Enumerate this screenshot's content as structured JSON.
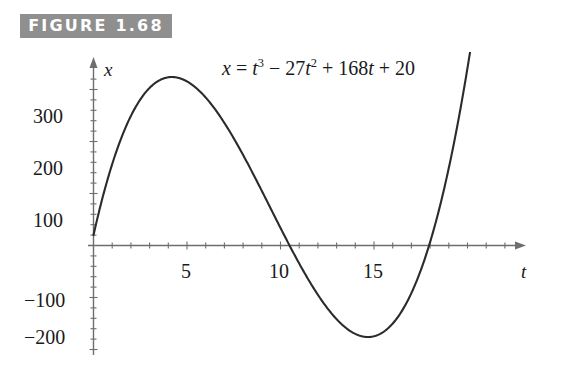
{
  "figure": {
    "label": "FIGURE 1.68",
    "banner_color": "#8f8f8f",
    "banner_text_color": "#ffffff",
    "background_color": "#ffffff",
    "curve_color": "#2b2b2b",
    "axis_color": "#6e6e6e"
  },
  "equation": {
    "lhs": "x",
    "equals": "=",
    "term1_base": "t",
    "term1_exp": "3",
    "op1": "−",
    "term2_coeff": "27",
    "term2_base": "t",
    "term2_exp": "2",
    "op2": "+",
    "term3": "168",
    "term3_base": "t",
    "op3": "+",
    "term4": "20",
    "plain": "x = t^3 - 27t^2 + 168t + 20"
  },
  "axes": {
    "x_axis_name": "t",
    "y_axis_name": "x",
    "x_ticks": [
      "5",
      "10",
      "15"
    ],
    "y_ticks": [
      "300",
      "200",
      "100",
      "−100",
      "−200"
    ]
  },
  "chart_data": {
    "type": "line",
    "title": "FIGURE 1.68",
    "annotation": "x = t³ − 27t² + 168t + 20",
    "xlabel": "t",
    "ylabel": "x",
    "xlim": [
      0,
      21.5
    ],
    "ylim": [
      -250,
      420
    ],
    "xticks": [
      5,
      10,
      15
    ],
    "yticks": [
      300,
      200,
      100,
      -100,
      -200
    ],
    "xtick_labels": [
      "5",
      "10",
      "15"
    ],
    "ytick_labels": [
      "300",
      "200",
      "100",
      "−100",
      "−200"
    ],
    "minor_tick_step_x": 1,
    "minor_tick_step_y": 20,
    "grid": false,
    "legend": false,
    "series": [
      {
        "name": "x = t^3 - 27t^2 + 168t + 20",
        "function": "t^3 - 27t^2 + 168t + 20",
        "x": [
          0,
          1,
          2,
          3,
          4,
          4.1,
          5,
          6,
          7,
          8,
          9,
          10,
          10.5,
          11,
          12,
          13,
          14,
          15,
          16,
          17,
          17.2,
          18,
          19,
          20,
          21,
          21.5
        ],
        "y": [
          20,
          162,
          256,
          308,
          324,
          324.1,
          310,
          272,
          216,
          148,
          74,
          0,
          -36.6,
          -68,
          -124,
          -162,
          -180,
          -178,
          -156,
          -114,
          -104,
          -52,
          28,
          140,
          284,
          369.4
        ]
      }
    ],
    "key_points": {
      "local_maximum": {
        "t": 4.12,
        "x": 324.3
      },
      "local_minimum": {
        "t": 13.88,
        "x": -180.3
      },
      "y_intercept": {
        "t": 0,
        "x": 20
      },
      "zero_crossings": [
        10.12,
        17.07
      ]
    }
  }
}
